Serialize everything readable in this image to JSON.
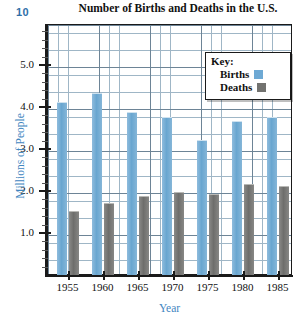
{
  "page": {
    "problem_number": "10"
  },
  "chart_data": {
    "type": "bar",
    "title": "Number of Births and Deaths in the U.S.",
    "xlabel": "Year",
    "ylabel": "Millions of People",
    "categories": [
      "1955",
      "1960",
      "1965",
      "1970",
      "1975",
      "1980",
      "1985"
    ],
    "series": [
      {
        "name": "Births",
        "color": "#6ea9d4",
        "values": [
          4.1,
          4.3,
          3.85,
          3.75,
          3.2,
          3.65,
          3.75
        ]
      },
      {
        "name": "Deaths",
        "color": "#72726f",
        "values": [
          1.5,
          1.7,
          1.85,
          1.95,
          1.9,
          2.15,
          2.1
        ]
      }
    ],
    "ylim": [
      0,
      6.0
    ],
    "yticks": [
      "1.0",
      "2.0",
      "3.0",
      "4.0",
      "5.0"
    ],
    "ytick_values": [
      1.0,
      2.0,
      3.0,
      4.0,
      5.0
    ],
    "grid": true,
    "legend": {
      "title": "Key:",
      "position": "top-right",
      "entries": [
        "Births",
        "Deaths"
      ]
    }
  },
  "colors": {
    "axis_title": "#3f86bf",
    "problem_number": "#2f6fa8",
    "grid": "#9fb6c6",
    "frame": "#1a1a1a"
  }
}
